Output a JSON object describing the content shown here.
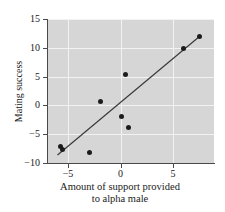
{
  "chart_data": {
    "type": "scatter",
    "title": "",
    "xlabel": "Amount of support provided to alpha male",
    "xlabel_line1": "Amount of support provided",
    "xlabel_line2": "to alpha male",
    "ylabel": "Mating success",
    "xlim": [
      -7.0,
      8.9
    ],
    "ylim": [
      -10,
      15
    ],
    "xticks": [
      -5,
      0,
      5
    ],
    "xticklabels": [
      "−5",
      "0",
      "5"
    ],
    "yticks": [
      -10,
      -5,
      0,
      5,
      10,
      15
    ],
    "yticklabels": [
      "−10",
      "−5",
      "0",
      "5",
      "10",
      "15"
    ],
    "grid": true,
    "grid_color": "#f2f2f2",
    "plot_bgcolor": "#d6d6d6",
    "figure_bgcolor": "#ffffff",
    "point_color": "#1c1c1c",
    "line_color": "#3a3a3a",
    "legend": null,
    "points": [
      {
        "x": -5.7,
        "y": -7.1
      },
      {
        "x": -5.5,
        "y": -7.6
      },
      {
        "x": -3.0,
        "y": -8.2
      },
      {
        "x": -1.9,
        "y": 0.7
      },
      {
        "x": 0.1,
        "y": -2.0
      },
      {
        "x": 0.5,
        "y": 5.3
      },
      {
        "x": 0.8,
        "y": -3.8
      },
      {
        "x": 6.0,
        "y": 9.9
      },
      {
        "x": 7.5,
        "y": 12.0
      }
    ],
    "fit_line": {
      "type": "linear-regression",
      "x_start": -6.0,
      "y_start": -8.6,
      "x_end": 7.6,
      "y_end": 12.1
    }
  }
}
